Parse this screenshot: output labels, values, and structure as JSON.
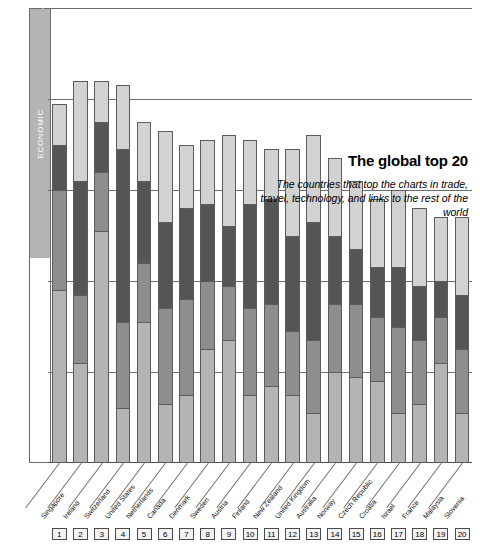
{
  "title": "The global top 20",
  "subtitle": "The countries that top the charts in trade, travel, technology, and links to the rest of the world",
  "legend": {
    "items": [
      {
        "label": "POLITICAL",
        "color": "#d2d2d2"
      },
      {
        "label": "TECHNOLOGICAL",
        "color": "#555555"
      },
      {
        "label": "PERSONAL",
        "color": "#8e8e8e"
      },
      {
        "label": "ECONOMIC",
        "color": "#b4b4b4"
      }
    ]
  },
  "chart_data": {
    "type": "bar",
    "title": "The global top 20",
    "subtitle": "The countries that top the charts in trade, travel, technology, and links to the rest of the world",
    "stacked": true,
    "xlabel": "",
    "ylabel": "",
    "ylim": [
      0,
      100
    ],
    "grid": true,
    "grid_values": [
      20,
      40,
      60,
      80,
      100
    ],
    "legend_position": "left-vertical-bar",
    "categories": [
      "Singapore",
      "Ireland",
      "Switzerland",
      "United States",
      "Netherlands",
      "Canada",
      "Denmark",
      "Sweden",
      "Austria",
      "Finland",
      "New Zealand",
      "United Kingdom",
      "Australia",
      "Norway",
      "Czech Republic",
      "Croatia",
      "Israel",
      "France",
      "Malaysia",
      "Slovenia"
    ],
    "ranks": [
      1,
      2,
      3,
      4,
      5,
      6,
      7,
      8,
      9,
      10,
      11,
      12,
      13,
      14,
      15,
      16,
      17,
      18,
      19,
      20
    ],
    "series": [
      {
        "name": "ECONOMIC",
        "color": "#b4b4b4",
        "values": [
          38.0,
          22.0,
          51.0,
          12.0,
          31.0,
          13.0,
          15.0,
          25.0,
          27.0,
          15.0,
          17.0,
          15.0,
          11.0,
          20.0,
          19.0,
          18.0,
          11.0,
          13.0,
          22.0,
          11.0
        ]
      },
      {
        "name": "PERSONAL",
        "color": "#8e8e8e",
        "values": [
          22.0,
          15.0,
          13.0,
          19.0,
          13.0,
          21.0,
          21.0,
          15.0,
          12.0,
          19.0,
          18.0,
          14.0,
          16.0,
          15.0,
          16.0,
          14.0,
          19.0,
          14.0,
          10.0,
          14.0
        ]
      },
      {
        "name": "TECHNOLOGICAL",
        "color": "#555555",
        "values": [
          10.0,
          25.0,
          11.0,
          38.0,
          18.0,
          19.0,
          20.0,
          17.0,
          13.0,
          23.0,
          23.0,
          21.0,
          26.0,
          15.0,
          12.0,
          11.0,
          13.0,
          12.0,
          8.0,
          12.0
        ]
      },
      {
        "name": "POLITICAL",
        "color": "#d2d2d2",
        "values": [
          9.0,
          22.0,
          9.0,
          14.0,
          13.0,
          20.0,
          14.0,
          14.0,
          20.0,
          14.0,
          11.0,
          19.0,
          19.0,
          17.0,
          15.0,
          15.0,
          17.0,
          17.0,
          14.0,
          17.0
        ]
      }
    ],
    "totals": [
      79.0,
      84.0,
      84.0,
      83.0,
      75.0,
      73.0,
      70.0,
      71.0,
      72.0,
      71.0,
      69.0,
      69.0,
      72.0,
      67.0,
      62.0,
      58.0,
      60.0,
      56.0,
      54.0,
      54.0
    ]
  }
}
